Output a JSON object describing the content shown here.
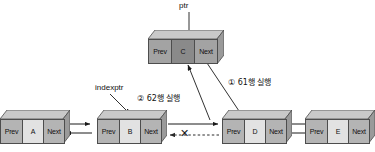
{
  "diagram": {
    "colors": {
      "node_side": "#b4b4b4",
      "node_data": "#e2e2e2",
      "node_highlight_data": "#8a8a8a",
      "outline": "#4d4d4d",
      "arrow": "#1a1a1a",
      "background": "#ffffff"
    },
    "field_labels": {
      "prev": "Prev",
      "next": "Next"
    },
    "nodes": [
      {
        "id": "A",
        "data": "A",
        "prev": "Prev",
        "next": "Next",
        "highlight": false
      },
      {
        "id": "B",
        "data": "B",
        "prev": "Prev",
        "next": "Next",
        "highlight": false
      },
      {
        "id": "C",
        "data": "C",
        "prev": "Prev",
        "next": "Next",
        "highlight": true
      },
      {
        "id": "D",
        "data": "D",
        "prev": "Prev",
        "next": "Next",
        "highlight": false
      },
      {
        "id": "E",
        "data": "E",
        "prev": "Prev",
        "next": "Next",
        "highlight": false
      }
    ],
    "pointers": [
      {
        "name": "ptr",
        "label": "ptr",
        "target": "C"
      },
      {
        "name": "indexptr",
        "label": "indexptr",
        "target": "B"
      }
    ],
    "annotations": [
      {
        "name": "step-1",
        "label": "① 61행 실행"
      },
      {
        "name": "step-2",
        "label": "② 62행 실행"
      }
    ],
    "broken_link": {
      "name": "broken-link-x",
      "symbol": "✕",
      "between": [
        "B",
        "D"
      ]
    }
  }
}
